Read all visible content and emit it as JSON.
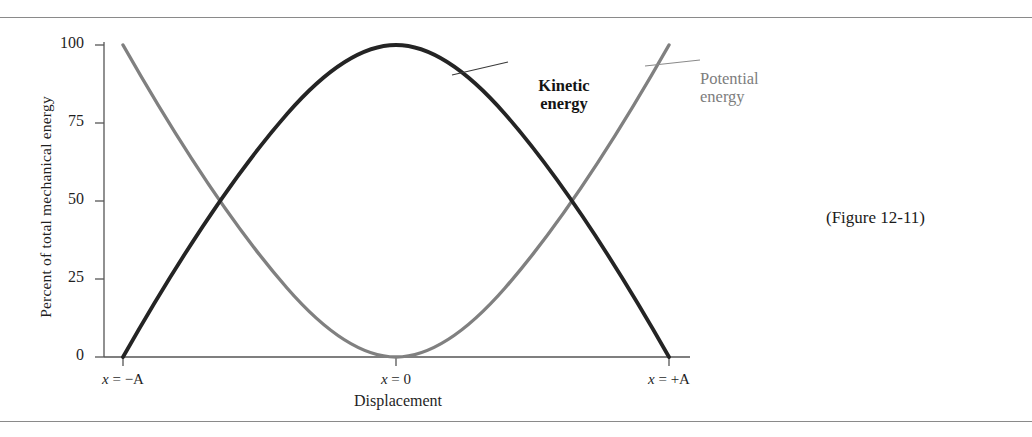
{
  "figure": {
    "caption": "(Figure 12-11)"
  },
  "chart_data": {
    "type": "line",
    "title": "",
    "xlabel": "Displacement",
    "ylabel": "Percent of total mechanical energy",
    "ylim": [
      0,
      100
    ],
    "yticks": [
      0,
      25,
      50,
      75,
      100
    ],
    "ytick_labels": [
      "0",
      "25",
      "50",
      "75",
      "100"
    ],
    "xlim": [
      -1,
      1
    ],
    "xticks": [
      -1,
      0,
      1
    ],
    "xtick_labels": [
      "x = −A",
      "x = 0",
      "x = +A"
    ],
    "grid": false,
    "legend": "inline-annotations",
    "x": [
      -1.0,
      -0.9,
      -0.8,
      -0.7,
      -0.6,
      -0.5,
      -0.4,
      -0.3,
      -0.2,
      -0.1,
      0.0,
      0.1,
      0.2,
      0.3,
      0.4,
      0.5,
      0.6,
      0.7,
      0.8,
      0.9,
      1.0
    ],
    "series": [
      {
        "name": "Kinetic energy",
        "color": "#242424",
        "annotation_position": "upper-center-right",
        "values": [
          0,
          19,
          36,
          51,
          64,
          75,
          84,
          91,
          96,
          99,
          100,
          99,
          96,
          91,
          84,
          75,
          64,
          51,
          36,
          19,
          0
        ]
      },
      {
        "name": "Potential energy",
        "color": "#808080",
        "annotation_position": "upper-right",
        "values": [
          100,
          81,
          64,
          49,
          36,
          25,
          16,
          9,
          4,
          1,
          0,
          1,
          4,
          9,
          16,
          25,
          36,
          49,
          64,
          81,
          100
        ]
      }
    ],
    "annotations": [
      {
        "text": "Kinetic energy",
        "target": "kinetic-curve"
      },
      {
        "text": "Potential energy",
        "target": "potential-curve"
      }
    ],
    "crossings": [
      {
        "x": -0.5,
        "y": 50
      },
      {
        "x": 0.5,
        "y": 50
      }
    ]
  },
  "colors": {
    "kinetic": "#242424",
    "potential": "#808080",
    "axis": "#555555",
    "rule": "#8a8a8a"
  }
}
